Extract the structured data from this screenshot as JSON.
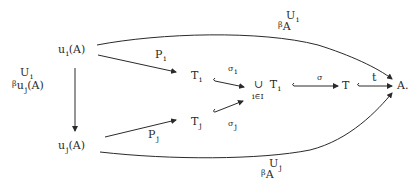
{
  "diagram": {
    "type": "commutative-diagram",
    "nodes": {
      "ui_A": {
        "base": "u",
        "sub": "i",
        "arg": "(A)"
      },
      "uj_A": {
        "base": "u",
        "sub": "j",
        "arg": "(A)"
      },
      "Ti": {
        "base": "T",
        "sub": "i"
      },
      "Tj": {
        "base": "T",
        "sub": "j"
      },
      "union": {
        "symbol": "∪",
        "base": "T",
        "sub": "i",
        "index": "i∈I"
      },
      "T": {
        "base": "T"
      },
      "A": {
        "base": "A."
      }
    },
    "edges": {
      "vertical": {
        "from": "u_i(A)",
        "to": "u_j(A)",
        "label_top": "U",
        "label_top_sub": "i",
        "label_beta": "β",
        "label_base": "u",
        "label_base_sub": "j",
        "label_arg": "(A)"
      },
      "Pi": {
        "from": "u_i(A)",
        "to": "T_i",
        "label": "P",
        "label_sub": "i"
      },
      "Pj": {
        "from": "u_j(A)",
        "to": "T_j",
        "label": "P",
        "label_sub": "j"
      },
      "sigma_i": {
        "from": "T_i",
        "to": "∪T_i",
        "label": "σ",
        "label_sub": "i"
      },
      "sigma_j": {
        "from": "T_j",
        "to": "∪T_i",
        "label": "σ",
        "label_sub": "j"
      },
      "sigma": {
        "from": "∪T_i",
        "to": "T",
        "label": "σ"
      },
      "t": {
        "from": "T",
        "to": "A",
        "label": "t"
      },
      "top_arc": {
        "from": "u_i(A)",
        "to": "A",
        "label_top": "U",
        "label_top_sub": "i",
        "label_beta": "β",
        "label_base": "A"
      },
      "bottom_arc": {
        "from": "u_j(A)",
        "to": "A",
        "label_top": "U",
        "label_top_sub": "j",
        "label_beta": "β",
        "label_base": "A"
      }
    },
    "colors": {
      "ink": "#2a2a2a",
      "background": "#ffffff"
    }
  }
}
